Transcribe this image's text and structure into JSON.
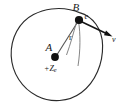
{
  "figure": {
    "type": "physics-diagram",
    "background_color": "#ffffff",
    "stroke_color": "#2b2b2b"
  },
  "labels": {
    "orbit_point": "B",
    "electron": "e",
    "center_point": "A",
    "nucleus_charge": "+Ze",
    "nucleus_charge_main": "+Z",
    "nucleus_charge_sub": "e",
    "radius": "r",
    "velocity": "v"
  },
  "geometry": {
    "orbit_center_x": 57,
    "orbit_center_y": 55,
    "orbit_radius": 45,
    "electron_x": 79,
    "electron_y": 20,
    "nucleus_x": 55,
    "nucleus_y": 57,
    "velocity_tip_x": 112,
    "velocity_tip_y": 37
  },
  "icons": {
    "electron_dot": "filled-circle-icon",
    "nucleus_dot": "filled-circle-icon",
    "velocity_arrow": "arrow-icon",
    "orbit_circle": "circle-icon"
  }
}
